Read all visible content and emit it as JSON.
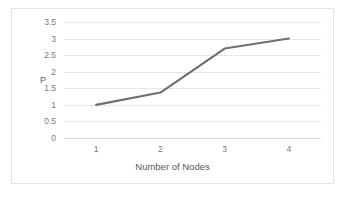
{
  "chart_data": {
    "type": "line",
    "title": "",
    "subtitle": "",
    "xlabel": "Number of Nodes",
    "ylabel": "P",
    "categories": [
      "1",
      "2",
      "3",
      "4"
    ],
    "x": [
      1,
      2,
      3,
      4
    ],
    "values": [
      1,
      1.37,
      2.7,
      3
    ],
    "series": [
      {
        "name": "P",
        "values": [
          1,
          1.37,
          2.7,
          3
        ],
        "color": "#6f6f6f"
      }
    ],
    "ylim": [
      0,
      3.5
    ],
    "yticks": [
      0,
      0.5,
      1,
      1.5,
      2,
      2.5,
      3,
      3.5
    ],
    "ytick_labels": [
      "0",
      "0.5",
      "1",
      "1.5",
      "2",
      "2.5",
      "3",
      "3.5"
    ],
    "xtick_labels": [
      "1",
      "2",
      "3",
      "4"
    ],
    "grid": true,
    "grid_axis": "y",
    "legend": false,
    "legend_position": "none",
    "markers": false,
    "annotations": []
  },
  "style": {
    "line_color": "#6f6f6f",
    "grid_color": "#e6e6e6",
    "border_color": "#e3e3e3",
    "tick_label_color": "#7a7a7a",
    "axis_title_color": "#595959",
    "plot_background": "#ffffff"
  }
}
